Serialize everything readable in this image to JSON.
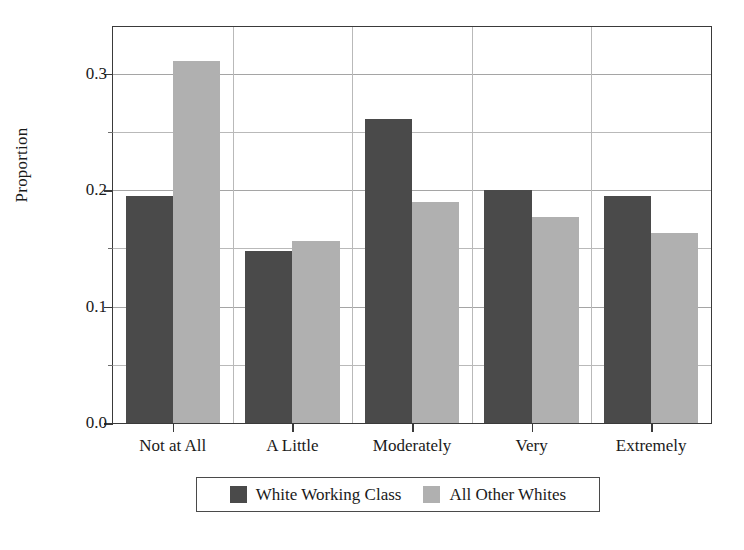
{
  "chart_data": {
    "type": "bar",
    "title": "",
    "xlabel": "",
    "ylabel": "Proportion",
    "categories": [
      "Not at All",
      "A Little",
      "Moderately",
      "Very",
      "Extremely"
    ],
    "series": [
      {
        "name": "White Working Class",
        "color": "#4a4a4a",
        "values": [
          0.195,
          0.148,
          0.261,
          0.2,
          0.195
        ]
      },
      {
        "name": "All Other Whites",
        "color": "#b0b0b0",
        "values": [
          0.311,
          0.156,
          0.19,
          0.177,
          0.163
        ]
      }
    ],
    "ylim": [
      0.0,
      0.34
    ],
    "ytick_labels": [
      "0.0",
      "0.1",
      "0.2",
      "0.3"
    ],
    "ytick_values": [
      0.0,
      0.1,
      0.2,
      0.3
    ],
    "yminor_values": [
      0.05,
      0.15,
      0.25
    ],
    "grid": "horizontal-and-vertical",
    "legend_position": "below-axes",
    "frame": true
  }
}
